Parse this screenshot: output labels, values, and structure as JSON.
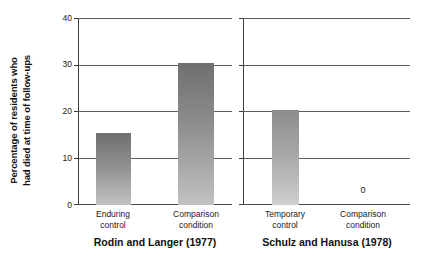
{
  "chart_data": {
    "type": "bar",
    "title": "",
    "xlabel": "",
    "ylabel_line1": "Percentage of residents who",
    "ylabel_line2": "had died at time of follow-ups",
    "ylim": [
      0,
      40
    ],
    "yticks": [
      0,
      10,
      20,
      30,
      40
    ],
    "ytick_labels": [
      "0",
      "10",
      "20",
      "30",
      "40"
    ],
    "grid": true,
    "legend": "none",
    "panels": [
      {
        "caption": "Rodin and Langer (1977)",
        "categories": [
          {
            "line1": "Enduring",
            "line2": "control"
          },
          {
            "line1": "Comparison",
            "line2": "condition"
          }
        ],
        "values": [
          15.4,
          30.6
        ],
        "value_labels": [
          "",
          ""
        ]
      },
      {
        "caption": "Schulz and Hanusa (1978)",
        "categories": [
          {
            "line1": "Temporary",
            "line2": "control"
          },
          {
            "line1": "Comparison",
            "line2": "condition"
          }
        ],
        "values": [
          20.4,
          0
        ],
        "value_labels": [
          "",
          "0"
        ]
      }
    ],
    "colors": {
      "bar_dark_top": "#6f6f6f",
      "bar_light_bottom": "#c2c2c2",
      "axis": "#3a3a3a",
      "grid": "#5a5a5a",
      "text": "#1a1a1a"
    }
  }
}
